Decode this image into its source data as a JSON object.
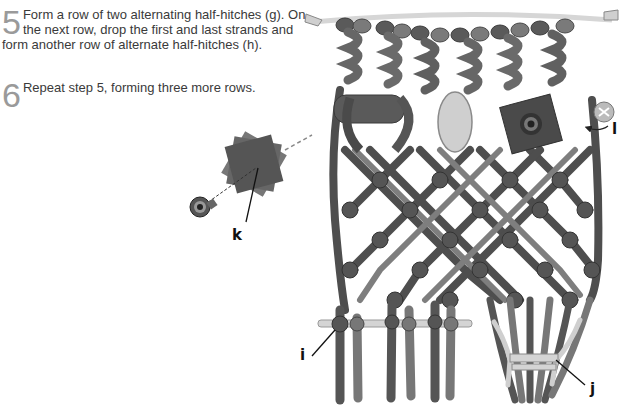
{
  "steps": [
    {
      "number": "5",
      "text": "Form a row of two alternating half-hitches (g). On the next row, drop the first and last strands and form another row of alternate half-hitches (h)."
    },
    {
      "number": "6",
      "text": "Repeat step 5, forming three more rows."
    }
  ],
  "callouts": {
    "k": "k",
    "l": "l",
    "i": "i",
    "j": "j"
  },
  "colors": {
    "cord_dark": "#4a4a4a",
    "cord_mid": "#6e6e6e",
    "cord_light": "#bdbdbd",
    "bead": "#cfcfcf"
  }
}
